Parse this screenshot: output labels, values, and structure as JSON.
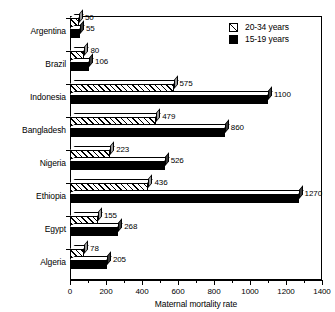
{
  "chart_data": {
    "type": "bar",
    "orientation": "horizontal",
    "title": "",
    "xlabel": "Maternal mortality rate",
    "ylabel": "",
    "xlim": [
      0,
      1400
    ],
    "xticks": [
      0,
      200,
      400,
      600,
      800,
      1000,
      1200,
      1400
    ],
    "xtick_minor_step": 100,
    "grid": false,
    "legend_position": "top-right",
    "categories": [
      "Argentina",
      "Brazil",
      "Indonesia",
      "Bangladesh",
      "Nigeria",
      "Ethiopia",
      "Egypt",
      "Algeria"
    ],
    "series": [
      {
        "name": "20-34 years",
        "style": "hatched",
        "values": [
          50,
          80,
          575,
          479,
          223,
          436,
          155,
          78
        ]
      },
      {
        "name": "15-19 years",
        "style": "solid-black",
        "values": [
          55,
          106,
          1100,
          860,
          526,
          1270,
          268,
          205
        ]
      }
    ]
  },
  "legend": {
    "items": [
      {
        "label": "20-34 years",
        "swatch": "hatched-square-icon"
      },
      {
        "label": "15-19 years",
        "swatch": "black-square-icon"
      }
    ]
  },
  "axis": {
    "x_title": "Maternal mortality rate",
    "tick_labels": [
      "0",
      "200",
      "400",
      "600",
      "800",
      "1000",
      "1200",
      "1400"
    ]
  },
  "colors": {
    "series_1_fill": "#ffffff",
    "series_1_hatch": "#000000",
    "series_2_fill": "#000000",
    "axis": "#000000",
    "side_face_light": "#9a9a9a",
    "side_face_dark": "#3a3a3a",
    "background": "#ffffff"
  }
}
